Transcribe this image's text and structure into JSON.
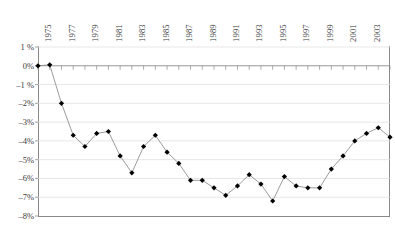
{
  "chart_data": {
    "type": "line",
    "title": "",
    "xlabel": "",
    "ylabel": "",
    "ylim": [
      -8,
      1
    ],
    "ytick_values": [
      1,
      0,
      -1,
      -2,
      -3,
      -4,
      -5,
      -6,
      -7,
      -8
    ],
    "ytick_labels": [
      "1 %",
      "0%",
      "–1 %",
      "–2%",
      "–3%",
      "–4%",
      "–5%",
      "–6%",
      "–7%",
      "–8%"
    ],
    "grid": true,
    "legend": "none",
    "marker": "diamond",
    "marker_color": "#000000",
    "line_color": "#808080",
    "x": [
      1974,
      1975,
      1976,
      1977,
      1978,
      1979,
      1980,
      1981,
      1982,
      1983,
      1984,
      1985,
      1986,
      1987,
      1988,
      1989,
      1990,
      1991,
      1992,
      1993,
      1994,
      1995,
      1996,
      1997,
      1998,
      1999,
      2000,
      2001,
      2002,
      2003,
      2004
    ],
    "xtick_labels": [
      "1975",
      "1977",
      "1979",
      "1981",
      "1983",
      "1985",
      "1987",
      "1989",
      "1991",
      "1993",
      "1995",
      "1997",
      "1999",
      "2001",
      "2003"
    ],
    "xtick_x": [
      1975,
      1977,
      1979,
      1981,
      1983,
      1985,
      1987,
      1989,
      1991,
      1993,
      1995,
      1997,
      1999,
      2001,
      2003
    ],
    "values": [
      0.0,
      0.05,
      -2.0,
      -3.7,
      -4.3,
      -3.6,
      -3.5,
      -4.8,
      -5.7,
      -4.3,
      -3.7,
      -4.6,
      -5.2,
      -6.1,
      -6.1,
      -6.5,
      -6.9,
      -6.4,
      -5.8,
      -6.3,
      -7.2,
      -5.9,
      -6.4,
      -6.5,
      -6.5,
      -5.5,
      -4.8,
      -4.0,
      -3.6,
      -3.3,
      -3.8
    ]
  }
}
